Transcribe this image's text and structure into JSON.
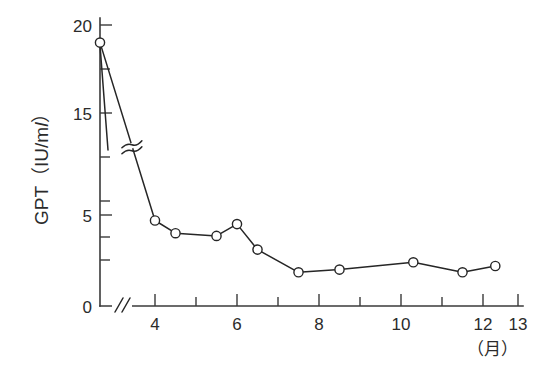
{
  "chart_data": {
    "type": "line",
    "title": "",
    "subtitle": "",
    "xlabel": "（月）",
    "ylabel": "GPT（IU/ml）",
    "ylabel_parts": {
      "prefix": "GPT（IU/m",
      "italic": "l",
      "suffix": "）"
    },
    "xlim": [
      3,
      13
    ],
    "ylim": [
      0,
      20
    ],
    "grid": false,
    "legend": null,
    "axis_break": {
      "y_axis_break": true,
      "y_break_between": [
        5,
        15
      ],
      "x_axis_break": true,
      "x_break_note": "double-slash break between origin and first labeled tick"
    },
    "x_ticks": [
      3,
      4,
      5,
      6,
      7,
      8,
      9,
      10,
      11,
      12,
      13
    ],
    "x_tick_labels": [
      "",
      "4",
      "",
      "6",
      "",
      "8",
      "",
      "10",
      "",
      "12",
      "13"
    ],
    "y_ticks": [
      0,
      2.5,
      5,
      7.5,
      10,
      12.5,
      15,
      17.5,
      20
    ],
    "y_tick_labels": [
      "0",
      "",
      "5",
      "",
      "",
      "",
      "15",
      "",
      "20"
    ],
    "series": [
      {
        "name": "GPT",
        "marker": "open-circle",
        "color": "#262626",
        "x": [
          3.0,
          4.0,
          4.5,
          5.5,
          6.0,
          6.5,
          7.5,
          8.5,
          10.3,
          11.5,
          12.3
        ],
        "y": [
          19.0,
          4.7,
          4.0,
          3.85,
          4.5,
          3.1,
          1.85,
          2.0,
          2.4,
          1.85,
          2.2
        ]
      }
    ]
  }
}
